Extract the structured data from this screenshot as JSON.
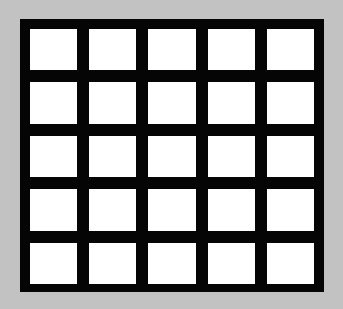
{
  "figure": {
    "name": "grid-pattern",
    "rows": 5,
    "columns": 5,
    "cell_count": 25,
    "colors": {
      "background": "#c2c2c2",
      "grid_line": "#050505",
      "cell_fill": "#ffffff"
    },
    "geometry": {
      "canvas_width": 343,
      "canvas_height": 309,
      "block_left": 20,
      "block_top": 19,
      "block_width": 304,
      "block_height": 273,
      "border_thickness": 10,
      "divider_thickness": 12,
      "cell_width": 46,
      "cell_height": 43
    },
    "cells": [
      [
        {
          "id": "r1c1",
          "fill": "#ffffff"
        },
        {
          "id": "r1c2",
          "fill": "#ffffff"
        },
        {
          "id": "r1c3",
          "fill": "#ffffff"
        },
        {
          "id": "r1c4",
          "fill": "#ffffff"
        },
        {
          "id": "r1c5",
          "fill": "#ffffff"
        }
      ],
      [
        {
          "id": "r2c1",
          "fill": "#ffffff"
        },
        {
          "id": "r2c2",
          "fill": "#ffffff"
        },
        {
          "id": "r2c3",
          "fill": "#ffffff"
        },
        {
          "id": "r2c4",
          "fill": "#ffffff"
        },
        {
          "id": "r2c5",
          "fill": "#ffffff"
        }
      ],
      [
        {
          "id": "r3c1",
          "fill": "#ffffff"
        },
        {
          "id": "r3c2",
          "fill": "#ffffff"
        },
        {
          "id": "r3c3",
          "fill": "#ffffff"
        },
        {
          "id": "r3c4",
          "fill": "#ffffff"
        },
        {
          "id": "r3c5",
          "fill": "#ffffff"
        }
      ],
      [
        {
          "id": "r4c1",
          "fill": "#ffffff"
        },
        {
          "id": "r4c2",
          "fill": "#ffffff"
        },
        {
          "id": "r4c3",
          "fill": "#ffffff"
        },
        {
          "id": "r4c4",
          "fill": "#ffffff"
        },
        {
          "id": "r4c5",
          "fill": "#ffffff"
        }
      ],
      [
        {
          "id": "r5c1",
          "fill": "#ffffff"
        },
        {
          "id": "r5c2",
          "fill": "#ffffff"
        },
        {
          "id": "r5c3",
          "fill": "#ffffff"
        },
        {
          "id": "r5c4",
          "fill": "#ffffff"
        },
        {
          "id": "r5c5",
          "fill": "#ffffff"
        }
      ]
    ]
  }
}
